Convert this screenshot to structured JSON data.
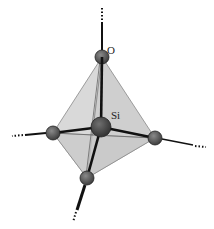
{
  "diagram": {
    "labels": {
      "oxygen": "O",
      "silicon": "Si"
    },
    "colors": {
      "face": "#d6d6d6",
      "face_dark": "#c4c4c4",
      "edge": "#777777",
      "bond": "#111111",
      "atom_si": "#4a4a4a",
      "atom_o": "#555555"
    },
    "atoms": [
      {
        "id": "O-top",
        "element": "O"
      },
      {
        "id": "O-left",
        "element": "O"
      },
      {
        "id": "O-right",
        "element": "O"
      },
      {
        "id": "O-bottom",
        "element": "O"
      },
      {
        "id": "Si-center",
        "element": "Si"
      }
    ]
  }
}
